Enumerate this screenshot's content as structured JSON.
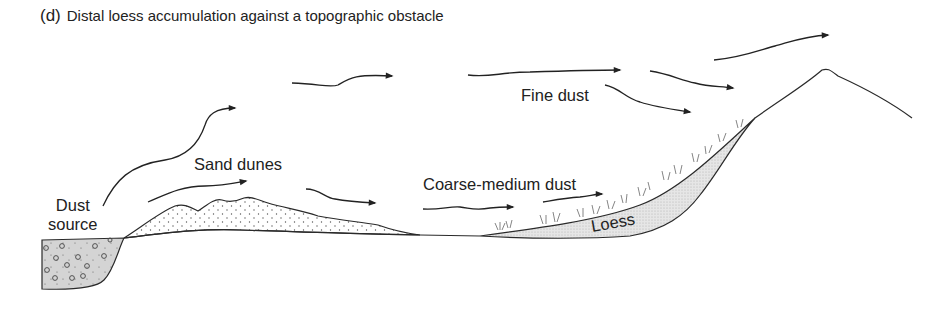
{
  "figure": {
    "tag": "(d)",
    "title": "Distal loess accumulation against a topographic obstacle"
  },
  "labels": {
    "dust_source_line1": "Dust",
    "dust_source_line2": "source",
    "sand_dunes": "Sand dunes",
    "fine_dust": "Fine dust",
    "coarse_medium_dust": "Coarse-medium dust",
    "loess": "Loess"
  },
  "colors": {
    "line": "#2a2a2a",
    "fill_loess": "#e4e4e4",
    "fill_source": "#d6d6d6",
    "text": "#222222"
  }
}
